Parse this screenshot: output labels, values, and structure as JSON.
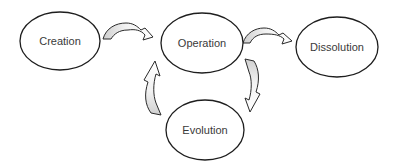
{
  "diagram": {
    "type": "lifecycle-flow",
    "colors": {
      "node_fill": "#ffffff",
      "node_stroke": "#1e1e1e",
      "label_text": "#3a3a3a",
      "arrow_tail_fill": "#d4d4d4",
      "arrow_head_fill": "#ffffff",
      "arrow_stroke": "#2a2a2a"
    },
    "nodes": [
      {
        "id": "creation",
        "label": "Creation"
      },
      {
        "id": "operation",
        "label": "Operation"
      },
      {
        "id": "dissolution",
        "label": "Dissolution"
      },
      {
        "id": "evolution",
        "label": "Evolution"
      }
    ],
    "edges": [
      {
        "from": "creation",
        "to": "operation"
      },
      {
        "from": "operation",
        "to": "dissolution"
      },
      {
        "from": "operation",
        "to": "evolution"
      },
      {
        "from": "evolution",
        "to": "operation"
      }
    ]
  }
}
